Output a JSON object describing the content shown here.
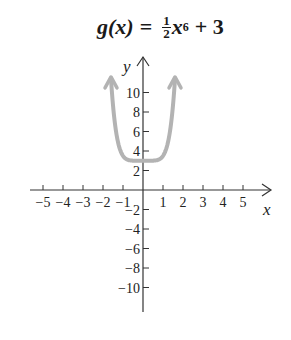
{
  "title": {
    "lhs": "g(x)",
    "equals": "=",
    "frac_num": "1",
    "frac_den": "2",
    "var": "x",
    "exp": "6",
    "rest": "+ 3"
  },
  "chart_data": {
    "type": "line",
    "function": "0.5*x^6 + 3",
    "xlabel": "x",
    "ylabel": "y",
    "x_ticks": [
      -5,
      -4,
      -3,
      -2,
      -1,
      1,
      2,
      3,
      4,
      5
    ],
    "y_ticks": [
      -10,
      -8,
      -6,
      -4,
      -2,
      2,
      4,
      6,
      8,
      10
    ],
    "xlim": [
      -5.5,
      5.5
    ],
    "ylim": [
      -11,
      13
    ],
    "grid": false,
    "series": [
      {
        "name": "g(x)",
        "color": "#b3b3b3",
        "x": [
          -1.65,
          -1.5,
          -1.25,
          -1,
          -0.75,
          -0.5,
          0,
          0.5,
          0.75,
          1,
          1.25,
          1.5,
          1.65
        ],
        "y": [
          11.8,
          8.7,
          4.9,
          3.5,
          3.09,
          3.01,
          3,
          3.01,
          3.09,
          3.5,
          4.9,
          8.7,
          11.8
        ]
      }
    ]
  },
  "colors": {
    "axis": "#333333",
    "curve": "#b3b3b3"
  }
}
